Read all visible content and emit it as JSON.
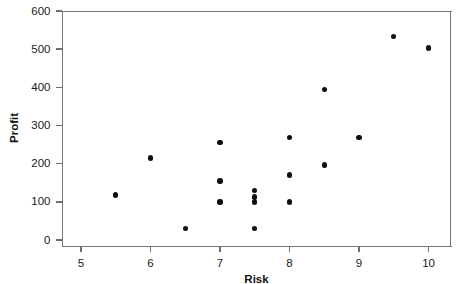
{
  "chart_data": {
    "type": "scatter",
    "title": "",
    "xlabel": "Risk",
    "ylabel": "Profit",
    "xlim": [
      4.72,
      10.33
    ],
    "ylim": [
      -17,
      600
    ],
    "grid": false,
    "legend": null,
    "xticks": [
      5,
      6,
      7,
      8,
      9,
      10
    ],
    "xtick_labels": [
      "5",
      "6",
      "7",
      "8",
      "9",
      "10"
    ],
    "yticks": [
      0,
      100,
      200,
      300,
      400,
      500,
      600
    ],
    "ytick_labels": [
      "0",
      "100",
      "200",
      "300",
      "400",
      "500",
      "600"
    ],
    "marker": "filled-circle",
    "marker_color": "#0d0d0d",
    "points": [
      {
        "x": 5.5,
        "y": 118
      },
      {
        "x": 6.0,
        "y": 215
      },
      {
        "x": 6.5,
        "y": 30
      },
      {
        "x": 7.0,
        "y": 255
      },
      {
        "x": 7.0,
        "y": 155
      },
      {
        "x": 7.0,
        "y": 100
      },
      {
        "x": 7.5,
        "y": 130
      },
      {
        "x": 7.5,
        "y": 113
      },
      {
        "x": 7.5,
        "y": 100
      },
      {
        "x": 7.5,
        "y": 30
      },
      {
        "x": 8.0,
        "y": 268
      },
      {
        "x": 8.0,
        "y": 170
      },
      {
        "x": 8.0,
        "y": 100
      },
      {
        "x": 8.5,
        "y": 395
      },
      {
        "x": 8.5,
        "y": 197
      },
      {
        "x": 9.0,
        "y": 268
      },
      {
        "x": 9.5,
        "y": 533
      },
      {
        "x": 10.0,
        "y": 503
      }
    ]
  },
  "axes": {
    "frame_color": "#777777",
    "tick_color": "#6e6e6e"
  }
}
